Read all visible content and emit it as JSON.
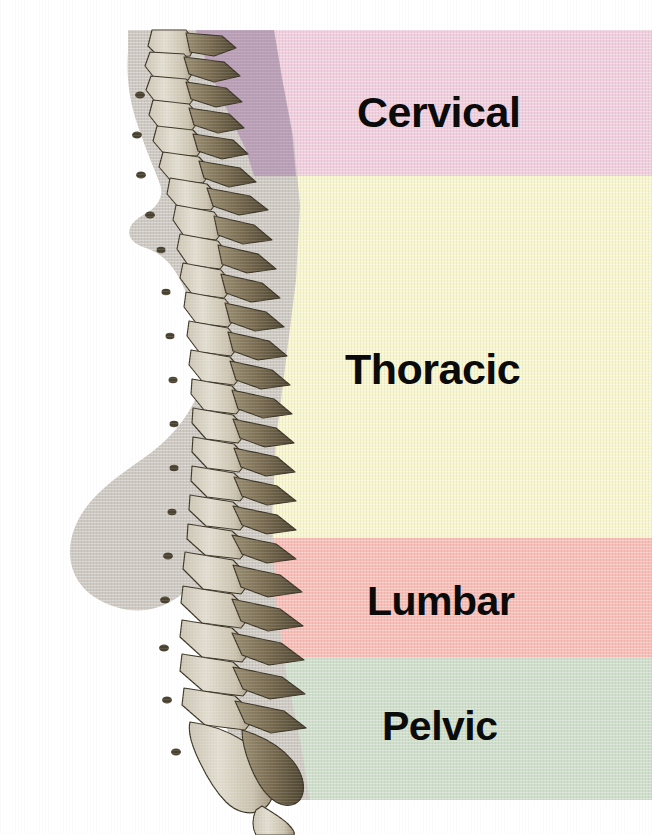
{
  "figure": {
    "canvas": {
      "width": 652,
      "height": 835,
      "background": "#ffffff"
    }
  },
  "regions": [
    {
      "id": "cervical",
      "label": "Cervical",
      "color": "#f1cedd",
      "band_top": 30,
      "band_bottom": 176
    },
    {
      "id": "thoracic",
      "label": "Thoracic",
      "color": "#f8f6ce",
      "band_top": 176,
      "band_bottom": 538
    },
    {
      "id": "lumbar",
      "label": "Lumbar",
      "color": "#f7bdb6",
      "band_top": 538,
      "band_bottom": 657
    },
    {
      "id": "pelvic",
      "label": "Pelvic",
      "color": "#cfdecb",
      "band_top": 657,
      "band_bottom": 800
    }
  ],
  "silhouette": {
    "name": "body-profile-silhouette",
    "color": "#cdc9c2",
    "description": "grey lateral profile of head, neck, chest and torso"
  },
  "cervical_overlay": {
    "name": "cervical-shadow-overlay",
    "color": "#b79bb5"
  },
  "spine": {
    "name": "vertebral-column-illustration",
    "bone_fill": "#d8d2c6",
    "bone_shade": "#6d6047",
    "bone_outline": "#40382a",
    "segments": [
      {
        "name": "cervical-vertebrae",
        "count": 7
      },
      {
        "name": "thoracic-vertebrae",
        "count": 12
      },
      {
        "name": "lumbar-vertebrae",
        "count": 5
      },
      {
        "name": "sacrum",
        "count": 1
      },
      {
        "name": "coccyx",
        "count": 1
      }
    ]
  }
}
